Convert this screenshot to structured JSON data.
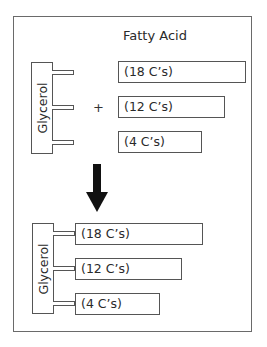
{
  "diagram": {
    "title": "Fatty Acid",
    "operator": "+",
    "reactants": {
      "glycerol_label": "Glycerol",
      "fatty_acids": [
        {
          "label": "(18 C’s)"
        },
        {
          "label": "(12 C’s)"
        },
        {
          "label": "(4 C’s)"
        }
      ]
    },
    "arrow": "down-arrow",
    "product": {
      "glycerol_label": "Glycerol",
      "fatty_acids": [
        {
          "label": "(18 C’s)"
        },
        {
          "label": "(12 C’s)"
        },
        {
          "label": "(4 C’s)"
        }
      ]
    }
  }
}
